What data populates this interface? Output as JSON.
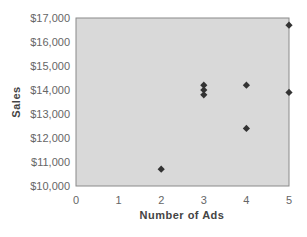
{
  "chart_data": {
    "type": "scatter",
    "title": "",
    "xlabel": "Number of Ads",
    "ylabel": "Sales",
    "xlim": [
      0,
      5
    ],
    "ylim": [
      10000,
      17000
    ],
    "x_ticks": [
      "0",
      "1",
      "2",
      "3",
      "4",
      "5"
    ],
    "y_ticks": [
      "$10,000",
      "$11,000",
      "$12,000",
      "$13,000",
      "$14,000",
      "$15,000",
      "$16,000",
      "$17,000"
    ],
    "grid": false,
    "legend": null,
    "series": [
      {
        "name": "Sales",
        "marker": "diamond",
        "points": [
          {
            "x": 2,
            "y": 10700
          },
          {
            "x": 3,
            "y": 14200
          },
          {
            "x": 3,
            "y": 14000
          },
          {
            "x": 3,
            "y": 13800
          },
          {
            "x": 4,
            "y": 14200
          },
          {
            "x": 4,
            "y": 12400
          },
          {
            "x": 5,
            "y": 16700
          },
          {
            "x": 5,
            "y": 13900
          }
        ]
      }
    ]
  },
  "colors": {
    "plot_background": "#d9d9d9",
    "plot_border": "#8a8a8a",
    "marker": "#333333"
  }
}
